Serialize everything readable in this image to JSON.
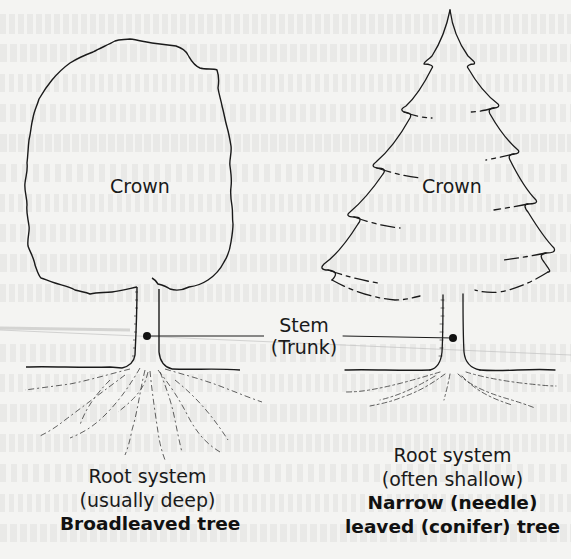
{
  "diagram": {
    "left_tree": {
      "crown_label": "Crown",
      "root_label_line1": "Root system",
      "root_label_line2": "(usually deep)",
      "title": "Broadleaved tree"
    },
    "stem": {
      "label_line1": "Stem",
      "label_line2": "(Trunk)"
    },
    "right_tree": {
      "crown_label": "Crown",
      "root_label_line1": "Root system",
      "root_label_line2": "(often shallow)",
      "title_line1": "Narrow (needle)",
      "title_line2": "leaved (conifer) tree"
    },
    "colors": {
      "background": "#f4f4f2",
      "ink": "#1a1a1a"
    }
  }
}
